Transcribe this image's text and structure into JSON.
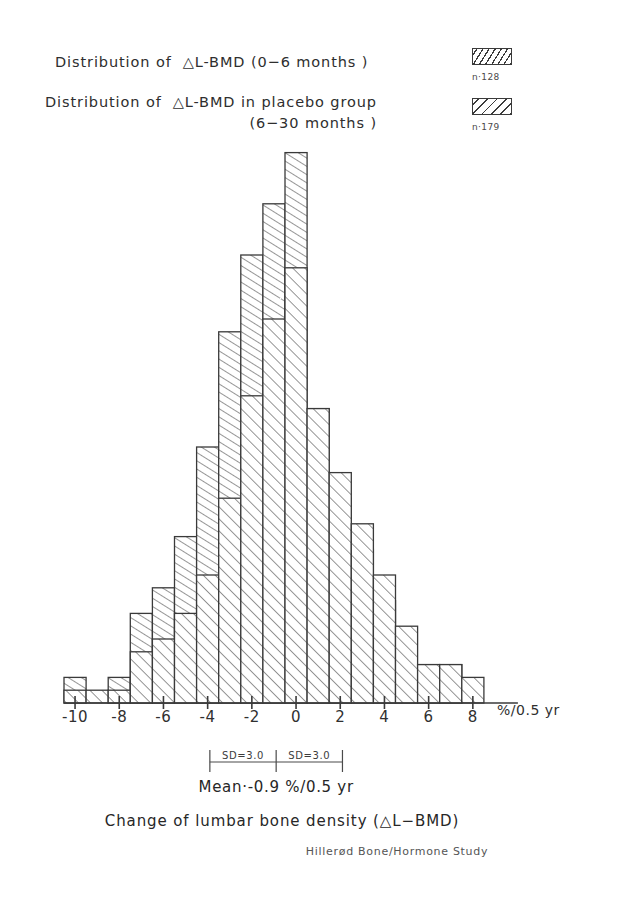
{
  "legend": {
    "entries": [
      {
        "label": "Distribution of  △L-BMD (0−6 months )",
        "n_label": "n·128",
        "pattern": "hatch-steep"
      },
      {
        "label_line1": "Distribution of  △L-BMD in placebo group",
        "label_line2": "(6−30 months )",
        "n_label": "n·179",
        "pattern": "hatch-diagonal"
      }
    ]
  },
  "annotations": {
    "sd_left": "SD=3.0",
    "sd_right": "SD=3.0",
    "mean": "Mean·-0.9 %/0.5 yr",
    "caption": "Change of lumbar bone density (△L−BMD)",
    "credit": "Hillerød Bone/Hormone Study"
  },
  "chart_data": {
    "type": "bar",
    "title": "",
    "xlabel": "Change of lumbar bone density (△L-BMD)",
    "ylabel": "",
    "axis_unit": "%/0.5 yr",
    "xlim": [
      -10.5,
      8.5
    ],
    "bin_width": 1,
    "xticks": [
      -10,
      -8,
      -6,
      -4,
      -2,
      0,
      2,
      4,
      6,
      8
    ],
    "xtick_labels": [
      "-10",
      "-8",
      "-6",
      "-4",
      "-2",
      "0",
      "2",
      "4",
      "6",
      "8"
    ],
    "grid": false,
    "legend_position": "top-right",
    "bin_starts": [
      -10.5,
      -9.5,
      -8.5,
      -7.5,
      -6.5,
      -5.5,
      -4.5,
      -3.5,
      -2.5,
      -1.5,
      -0.5,
      0.5,
      1.5,
      2.5,
      3.5,
      4.5,
      5.5,
      6.5,
      7.5
    ],
    "series": [
      {
        "name": "Distribution of △L-BMD (0−6 months)",
        "n": 128,
        "pattern": "hatch-steep",
        "values": [
          2,
          0,
          2,
          7,
          9,
          13,
          20,
          29,
          35,
          39,
          43,
          23,
          16,
          12,
          8,
          3,
          3,
          3,
          0
        ]
      },
      {
        "name": "Distribution of △L-BMD in placebo group (6−30 months)",
        "n": 179,
        "pattern": "hatch-diagonal",
        "values": [
          1,
          1,
          1,
          4,
          5,
          7,
          10,
          16,
          24,
          30,
          34,
          23,
          18,
          14,
          10,
          6,
          3,
          3,
          2
        ]
      }
    ],
    "mean": -0.9,
    "sd": 3.0
  },
  "layout": {
    "x_origin_px": 64,
    "px_per_unit": 22.1,
    "baseline_y_px": 703,
    "px_per_count": 12.8
  }
}
